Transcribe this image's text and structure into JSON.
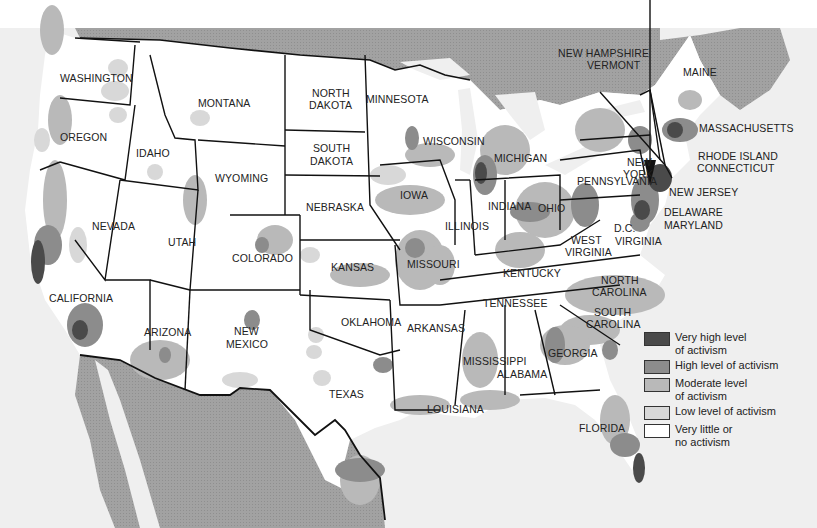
{
  "map": {
    "title": "",
    "subject": "Levels of activism across the contiguous United States",
    "colors": {
      "very_high": "#4a4a4a",
      "high": "#8c8c8c",
      "moderate": "#b9b9b9",
      "low": "#d8d8d8",
      "none": "#ffffff",
      "foreign_land": "#9a9a9a",
      "water": "#efefef",
      "border": "#111111"
    },
    "arrow": {
      "from": [
        650,
        0
      ],
      "to": [
        650,
        185
      ],
      "target": "New York City area"
    },
    "state_labels": [
      {
        "name": "WASHINGTON",
        "x": 60,
        "y": 82
      },
      {
        "name": "MONTANA",
        "x": 198,
        "y": 107
      },
      {
        "name": "NORTH",
        "x": 312,
        "y": 97
      },
      {
        "name": "DAKOTA",
        "x": 309,
        "y": 109
      },
      {
        "name": "MINNESOTA",
        "x": 366,
        "y": 103
      },
      {
        "name": "OREGON",
        "x": 60,
        "y": 141
      },
      {
        "name": "IDAHO",
        "x": 136,
        "y": 157
      },
      {
        "name": "SOUTH",
        "x": 313,
        "y": 152
      },
      {
        "name": "DAKOTA",
        "x": 310,
        "y": 165
      },
      {
        "name": "WISCONSIN",
        "x": 423,
        "y": 145
      },
      {
        "name": "MICHIGAN",
        "x": 494,
        "y": 162
      },
      {
        "name": "NEW",
        "x": 627,
        "y": 166
      },
      {
        "name": "YORK",
        "x": 623,
        "y": 178
      },
      {
        "name": "MASSACHUSETTS",
        "x": 699,
        "y": 132
      },
      {
        "name": "RHODE ISLAND",
        "x": 698,
        "y": 160
      },
      {
        "name": "CONNECTICUT",
        "x": 697,
        "y": 172
      },
      {
        "name": "NEW JERSEY",
        "x": 669,
        "y": 196
      },
      {
        "name": "DELAWARE",
        "x": 664,
        "y": 216
      },
      {
        "name": "MARYLAND",
        "x": 664,
        "y": 229
      },
      {
        "name": "NEW HAMPSHIRE",
        "x": 558,
        "y": 57
      },
      {
        "name": "VERMONT",
        "x": 587,
        "y": 69
      },
      {
        "name": "MAINE",
        "x": 683,
        "y": 76
      },
      {
        "name": "WYOMING",
        "x": 215,
        "y": 182
      },
      {
        "name": "NEBRASKA",
        "x": 306,
        "y": 211
      },
      {
        "name": "IOWA",
        "x": 400,
        "y": 199
      },
      {
        "name": "ILLINOIS",
        "x": 445,
        "y": 230
      },
      {
        "name": "INDIANA",
        "x": 488,
        "y": 210
      },
      {
        "name": "OHIO",
        "x": 538,
        "y": 212
      },
      {
        "name": "PENNSYLVANIA",
        "x": 577,
        "y": 185
      },
      {
        "name": "NEVADA",
        "x": 92,
        "y": 230
      },
      {
        "name": "UTAH",
        "x": 168,
        "y": 246
      },
      {
        "name": "COLORADO",
        "x": 232,
        "y": 262
      },
      {
        "name": "KANSAS",
        "x": 331,
        "y": 271
      },
      {
        "name": "MISSOURI",
        "x": 407,
        "y": 268
      },
      {
        "name": "KENTUCKY",
        "x": 503,
        "y": 277
      },
      {
        "name": "WEST",
        "x": 571,
        "y": 244
      },
      {
        "name": "VIRGINIA",
        "x": 565,
        "y": 256
      },
      {
        "name": "D.C.",
        "x": 614,
        "y": 232
      },
      {
        "name": "VIRGINIA",
        "x": 615,
        "y": 245
      },
      {
        "name": "CALIFORNIA",
        "x": 49,
        "y": 302
      },
      {
        "name": "TENNESSEE",
        "x": 483,
        "y": 307
      },
      {
        "name": "NORTH",
        "x": 601,
        "y": 284
      },
      {
        "name": "CAROLINA",
        "x": 592,
        "y": 296
      },
      {
        "name": "SOUTH",
        "x": 594,
        "y": 316
      },
      {
        "name": "CAROLINA",
        "x": 586,
        "y": 328
      },
      {
        "name": "OKLAHOMA",
        "x": 341,
        "y": 326
      },
      {
        "name": "ARKANSAS",
        "x": 407,
        "y": 332
      },
      {
        "name": "ARIZONA",
        "x": 144,
        "y": 336
      },
      {
        "name": "NEW",
        "x": 234,
        "y": 335
      },
      {
        "name": "MEXICO",
        "x": 226,
        "y": 348
      },
      {
        "name": "GEORGIA",
        "x": 548,
        "y": 357
      },
      {
        "name": "MISSISSIPPI",
        "x": 463,
        "y": 365
      },
      {
        "name": "ALABAMA",
        "x": 497,
        "y": 378
      },
      {
        "name": "TEXAS",
        "x": 329,
        "y": 398
      },
      {
        "name": "LOUISIANA",
        "x": 427,
        "y": 413
      },
      {
        "name": "FLORIDA",
        "x": 579,
        "y": 432
      }
    ]
  },
  "legend": {
    "items": [
      {
        "level": "very_high",
        "label_line1": "Very high level",
        "label_line2": "of activism",
        "color": "#4a4a4a"
      },
      {
        "level": "high",
        "label_line1": "High level of activism",
        "label_line2": "",
        "color": "#8c8c8c"
      },
      {
        "level": "moderate",
        "label_line1": "Moderate level",
        "label_line2": "of activism",
        "color": "#b9b9b9"
      },
      {
        "level": "low",
        "label_line1": "Low level of activism",
        "label_line2": "",
        "color": "#d8d8d8"
      },
      {
        "level": "none",
        "label_line1": "Very little or",
        "label_line2": "no activism",
        "color": "#ffffff"
      }
    ]
  }
}
